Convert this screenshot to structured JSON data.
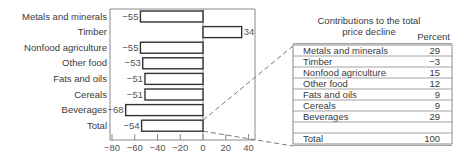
{
  "chart_data": [
    {
      "type": "bar",
      "orientation": "horizontal",
      "title": "",
      "xlabel": "",
      "ylabel": "",
      "categories": [
        "Metals and minerals",
        "Timber",
        "Nonfood agriculture",
        "Other food",
        "Fats and oils",
        "Cereals",
        "Beverages",
        "Total"
      ],
      "values": [
        -55,
        34,
        -55,
        -53,
        -51,
        -51,
        -68,
        -54
      ],
      "value_labels": [
        "−55",
        "34",
        "−55",
        "−53",
        "−51",
        "−51",
        "−68",
        "−54"
      ],
      "xlim": [
        -80,
        40
      ],
      "xticks": [
        -80,
        -60,
        -40,
        -20,
        0,
        20,
        40
      ],
      "xtick_labels": [
        "−80",
        "−60",
        "−40",
        "−20",
        "0",
        "20",
        "40"
      ],
      "grid": false,
      "legend": null
    },
    {
      "type": "table",
      "title": "Contributions to the total price decline",
      "title_lines": [
        "Contributions to the total",
        "price decline"
      ],
      "columns": [
        "",
        "Percent"
      ],
      "rows": [
        {
          "label": "Metals and minerals",
          "value": "29"
        },
        {
          "label": "Timber",
          "value": "−3"
        },
        {
          "label": "Nonfood agriculture",
          "value": "15"
        },
        {
          "label": "Other food",
          "value": "12"
        },
        {
          "label": "Fats and oils",
          "value": "9"
        },
        {
          "label": "Cereals",
          "value": "9"
        },
        {
          "label": "Beverages",
          "value": "29"
        },
        {
          "label": "",
          "value": ""
        },
        {
          "label": "Total",
          "value": "100"
        }
      ]
    }
  ],
  "colors": {
    "bar_stroke": "#333333",
    "bar_fill": "#ffffff",
    "frame": "#8a8a8a",
    "text": "#3a3a3a",
    "connector": "#777777"
  }
}
